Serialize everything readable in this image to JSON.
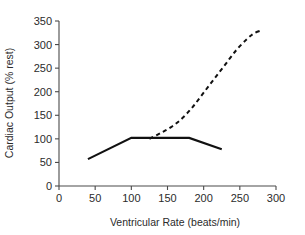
{
  "chart_data": {
    "type": "line",
    "title": "",
    "xlabel": "Ventricular Rate (beats/min)",
    "ylabel": "Cardiac Output (% rest)",
    "xlim": [
      0,
      300
    ],
    "ylim": [
      0,
      350
    ],
    "xticks": [
      0,
      50,
      100,
      150,
      200,
      250,
      300
    ],
    "yticks": [
      0,
      50,
      100,
      150,
      200,
      250,
      300,
      350
    ],
    "xtick_labels": [
      "0",
      "50",
      "100",
      "150",
      "200",
      "250",
      "300"
    ],
    "ytick_labels": [
      "0",
      "50",
      "100",
      "150",
      "200",
      "250",
      "300",
      "350"
    ],
    "grid": false,
    "legend": "none",
    "series": [
      {
        "name": "solid-line",
        "style": "solid",
        "color": "#111111",
        "x": [
          40,
          100,
          180,
          225
        ],
        "y": [
          57,
          102,
          102,
          78
        ]
      },
      {
        "name": "dashed-curve",
        "style": "dashed",
        "color": "#111111",
        "x": [
          125,
          140,
          155,
          170,
          185,
          200,
          215,
          230,
          245,
          260,
          270,
          280
        ],
        "y": [
          100,
          112,
          125,
          143,
          168,
          198,
          228,
          258,
          288,
          312,
          324,
          330
        ]
      }
    ]
  },
  "axes": {
    "x_axis_name": "x-axis",
    "y_axis_name": "y-axis"
  }
}
